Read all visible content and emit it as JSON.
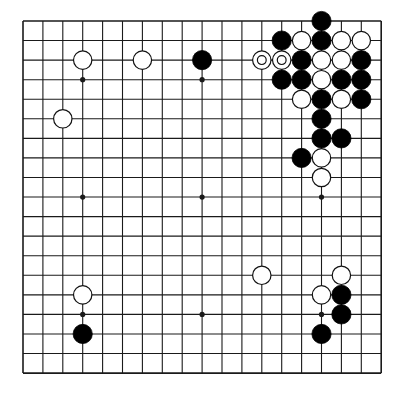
{
  "board": {
    "size": 19,
    "origin_x": 23,
    "origin_y": 21,
    "spacing_x": 19.9,
    "spacing_y": 19.56,
    "line_color": "#1a1a1a",
    "background": "#ffffff",
    "star_points": [
      [
        3,
        3
      ],
      [
        9,
        3
      ],
      [
        15,
        3
      ],
      [
        3,
        9
      ],
      [
        9,
        9
      ],
      [
        15,
        9
      ],
      [
        3,
        15
      ],
      [
        9,
        15
      ],
      [
        15,
        15
      ]
    ],
    "stone_radius": 9.6
  },
  "stones": {
    "black": [
      [
        15,
        0
      ],
      [
        13,
        1
      ],
      [
        15,
        1
      ],
      [
        14,
        2
      ],
      [
        17,
        2
      ],
      [
        13,
        3
      ],
      [
        14,
        3
      ],
      [
        16,
        3
      ],
      [
        17,
        3
      ],
      [
        15,
        4
      ],
      [
        17,
        4
      ],
      [
        15,
        5
      ],
      [
        15,
        6
      ],
      [
        16,
        6
      ],
      [
        14,
        7
      ],
      [
        9,
        2
      ],
      [
        16,
        14
      ],
      [
        16,
        15
      ],
      [
        15,
        16
      ],
      [
        3,
        16
      ]
    ],
    "white": [
      [
        14,
        1
      ],
      [
        16,
        1
      ],
      [
        17,
        1
      ],
      [
        15,
        2
      ],
      [
        16,
        2
      ],
      [
        15,
        3
      ],
      [
        14,
        4
      ],
      [
        16,
        4
      ],
      [
        15,
        7
      ],
      [
        15,
        8
      ],
      [
        3,
        2
      ],
      [
        6,
        2
      ],
      [
        2,
        5
      ],
      [
        12,
        13
      ],
      [
        16,
        13
      ],
      [
        15,
        14
      ],
      [
        3,
        14
      ]
    ],
    "white_marked": [
      [
        12,
        2
      ],
      [
        13,
        2
      ]
    ]
  },
  "colors": {
    "black_stone": "#000000",
    "white_stone": "#ffffff",
    "stone_outline": "#111111"
  }
}
